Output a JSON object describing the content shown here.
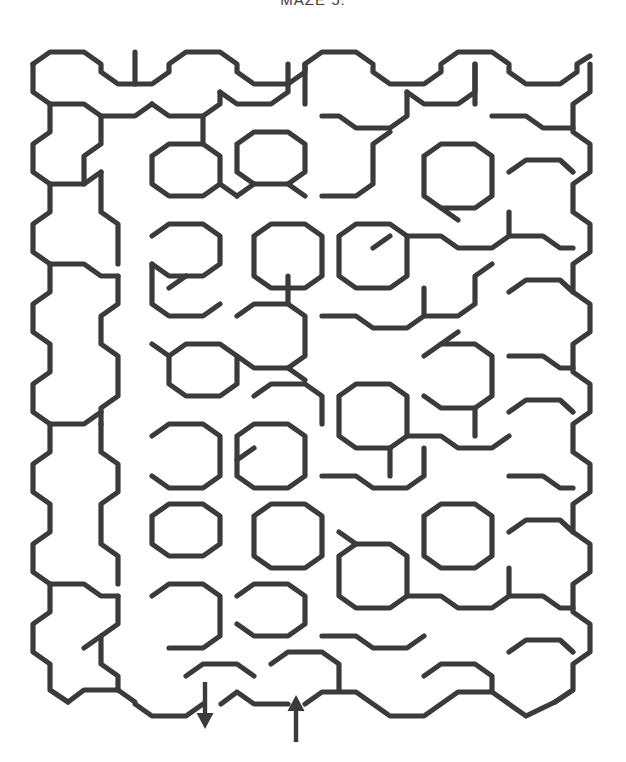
{
  "page": {
    "title": "MAZE 5:",
    "background_color": "#ffffff",
    "width": 626,
    "height": 762
  },
  "maze": {
    "type": "hexagonal-cell-maze",
    "wall_color": "#3b3b3b",
    "wall_width": 5.2,
    "origin_x": 33,
    "origin_y": 47,
    "col_step": 46,
    "row_step": 40,
    "cols": 12,
    "rows": 16,
    "bounds": {
      "left": 33,
      "top": 45,
      "right": 590,
      "bottom": 705
    },
    "entrance": {
      "label": "entrance",
      "direction": "up",
      "x": 296,
      "y": 712
    },
    "exit": {
      "label": "exit",
      "direction": "down",
      "x": 205,
      "y": 712
    },
    "wall_paths": [
      "M33,64 L33,92 L50,104 L50,132 L33,144 L33,172 L50,184 L50,212 L33,224 L33,252 L50,264 L50,292 L33,304 L33,332 L50,344 L50,372 L33,384 L33,412 L50,424 L50,452 L33,464 L33,492 L50,504 L50,532 L33,544 L33,572 L50,584 L50,612 L33,624 L33,652 L50,664 L50,690 L68,702",
      "M590,64 L590,92 L573,104 L573,132 L590,144 L590,172 L573,184 L573,212 L590,224 L590,252 L573,264 L573,292 L590,304 L590,332 L573,344 L573,372 L590,384 L590,412 L573,424 L573,452 L590,464 L590,492 L573,504 L573,532 L590,544 L590,572 L573,584 L573,612 L590,624 L590,652 L573,664 L573,690 L555,702",
      "M33,64 L50,52 L84,52 L101,64 L101,72 L118,84 L152,84 L169,72 L169,64 L186,52 L220,52 L237,64 L237,72 L254,84 L288,84 L305,72 L305,64 L322,52 L356,52 L373,64 L373,72 L390,84 L424,84 L441,72 L441,64 L458,52 L492,52 L509,64 L509,72 L526,84 L560,84 L577,72 L577,64 L590,56",
      "M68,702 L84,690 L118,690 L135,702 L135,704 L152,716 L186,716 L203,704",
      "M221,704 L237,692 L254,704 L288,704",
      "M305,704 L322,692 L356,692 L373,704 L373,704 L390,716 L424,716 L441,704 L441,704 L458,692 L492,692 L509,704 L509,704 L526,716 L555,702",
      "M50,104 L84,104 L101,116 L135,116 L152,104",
      "M50,184 L84,184 L101,172",
      "M50,264 L84,264 L101,276 L118,276",
      "M50,424 L84,424 L101,412",
      "M50,584 L84,584 L101,596 L118,596",
      "M101,116 L101,144 L84,156 L84,184",
      "M101,172 L101,212 L118,224 L118,264",
      "M118,276 L118,304 L101,316 L101,344 L118,356 L118,396 L101,408 L101,424",
      "M101,424 L101,452 L118,464 L118,492 L101,504 L101,544 L118,556 L118,584",
      "M118,596 L118,624 L101,636 L101,664 L118,676 L118,690",
      "M152,104 L169,116 L203,116 L220,104 L220,92",
      "M152,156 L169,144 L203,144 L220,156 L220,184 L203,196 L169,196 L152,184 L152,156",
      "M152,236 L169,224 L203,224 L220,236 L220,264 L203,276 L169,276 L152,264",
      "M152,264 L152,304 L169,316 L203,316 L220,304",
      "M169,356 L186,344 L220,344 L237,356 L237,384 L220,396 L186,396 L169,384 L169,356",
      "M152,436 L169,424 L203,424 L220,436 L220,476 L203,488 L169,488 L152,476",
      "M152,516 L169,504 L203,504 L220,516 L220,544 L203,556 L169,556 L152,544 L152,516",
      "M152,596 L169,584 L203,584 L220,596 L220,636 L203,648 L169,648",
      "M186,676 L203,664 L237,664 L254,676",
      "M220,92 L237,104 L271,104 L288,92 L288,64",
      "M237,144 L254,132 L288,132 L305,144 L305,172 L288,184 L254,184 L237,172 L237,144",
      "M237,196 L254,184",
      "M254,236 L271,224 L305,224 L322,236 L322,276 L305,288 L271,288 L254,276 L254,236",
      "M237,316 L254,304 L288,304 L305,316 L305,356 L288,368 L254,368 L237,356",
      "M254,396 L271,384 L305,384 L322,396 L322,424",
      "M237,436 L254,424 L288,424 L305,436 L305,476 L288,488 L254,488 L237,476 L237,436",
      "M254,516 L271,504 L305,504 L322,516 L322,556 L305,568 L271,568 L254,556 L254,516",
      "M237,596 L254,584 L288,584 L305,596 L305,624 L288,636 L254,636 L237,624",
      "M271,664 L288,652 L322,652 L339,664 L339,690",
      "M322,116 L339,116 L356,128 L390,128 L407,116 L407,92",
      "M322,196 L356,196 L373,184 L373,144 L390,132",
      "M339,236 L356,224 L390,224 L407,236 L407,276 L390,288 L356,288 L339,276 L339,236",
      "M322,316 L356,316 L373,328 L407,328 L424,316 L424,288",
      "M339,396 L356,384 L390,384 L407,396 L407,436 L390,448 L356,448 L339,436 L339,396",
      "M322,476 L356,476 L373,488 L407,488 L424,476 L424,448",
      "M339,556 L356,544 L390,544 L407,556 L407,596 L390,608 L356,608 L339,596 L339,556",
      "M322,636 L356,636 L373,648 L407,648 L424,636",
      "M407,92 L424,104 L458,104 L475,92 L475,64",
      "M424,156 L441,144 L475,144 L492,156 L492,196 L475,208 L441,208 L424,196 L424,156",
      "M407,236 L441,236 L458,248 L492,248 L509,236 L509,212",
      "M424,316 L458,316 L475,304 L475,276 L492,264",
      "M424,356 L441,344 L475,344 L492,356 L492,396 L475,408 L441,408 L424,396",
      "M407,436 L441,436 L458,448 L492,448 L509,436",
      "M424,516 L441,504 L475,504 L492,516 L492,556 L475,568 L441,568 L424,556 L424,516",
      "M407,596 L441,596 L458,608 L492,608 L509,596 L509,568",
      "M424,676 L441,664 L475,664 L492,676 L492,690",
      "M492,116 L526,116 L543,128 L573,128",
      "M509,172 L526,160 L560,160 L573,172",
      "M509,236 L543,236 L560,248 L573,248",
      "M509,292 L526,280 L560,280 L573,292",
      "M509,356 L543,356 L560,368 L573,368",
      "M509,412 L526,400 L560,400 L573,412",
      "M509,476 L543,476 L560,488 L573,488",
      "M509,532 L526,520 L560,520 L573,532",
      "M509,596 L543,596 L560,608 L573,608",
      "M509,652 L526,640 L560,640 L573,652",
      "M135,52 L135,84",
      "M305,64 L305,104",
      "M475,64 L475,104",
      "M220,184 L237,196",
      "M288,184 L305,196",
      "M152,344 L169,356",
      "M288,368 L305,380",
      "M441,208 L458,220",
      "M101,636 L84,648",
      "M373,248 L390,236",
      "M186,276 L169,288",
      "M254,448 L237,460",
      "M441,344 L458,332",
      "M356,544 L339,532",
      "M203,116 L203,144",
      "M288,304 L288,276",
      "M390,448 L390,476",
      "M475,408 L475,436"
    ]
  }
}
